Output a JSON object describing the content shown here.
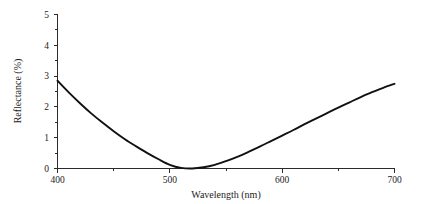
{
  "chart_data": {
    "type": "line",
    "title": "",
    "subtitle": "",
    "xlabel": "Wavelength (nm)",
    "ylabel": "Reflectance (%)",
    "xlim": [
      400,
      700
    ],
    "ylim": [
      0,
      5
    ],
    "grid": false,
    "legend": null,
    "legend_position": "none",
    "xticks": [
      400,
      500,
      600,
      700
    ],
    "xtick_labels": [
      "400",
      "500",
      "600",
      "700"
    ],
    "xticks_minor": [
      450,
      550,
      650
    ],
    "yticks": [
      0,
      1,
      2,
      3,
      4,
      5
    ],
    "ytick_labels": [
      "0",
      "1",
      "2",
      "3",
      "4",
      "5"
    ],
    "yticks_minor": [
      0.5,
      1.5,
      2.5,
      3.5,
      4.5
    ],
    "series": [
      {
        "name": "Reflectance",
        "color": "#111111",
        "x": [
          400,
          410,
          420,
          430,
          440,
          450,
          460,
          470,
          480,
          490,
          500,
          510,
          520,
          530,
          540,
          550,
          560,
          570,
          580,
          590,
          600,
          610,
          620,
          630,
          640,
          650,
          660,
          670,
          680,
          690,
          700
        ],
        "values": [
          2.85,
          2.47,
          2.12,
          1.79,
          1.49,
          1.21,
          0.95,
          0.72,
          0.5,
          0.3,
          0.12,
          0.02,
          0.0,
          0.04,
          0.12,
          0.24,
          0.38,
          0.54,
          0.71,
          0.89,
          1.07,
          1.25,
          1.44,
          1.62,
          1.8,
          1.98,
          2.15,
          2.32,
          2.48,
          2.62,
          2.75
        ]
      }
    ],
    "annotations": []
  },
  "axis": {
    "x_label": "Wavelength (nm)",
    "y_label": "Reflectance (%)",
    "x_tick_labels": [
      "400",
      "500",
      "600",
      "700"
    ],
    "y_tick_labels": [
      "0",
      "1",
      "2",
      "3",
      "4",
      "5"
    ]
  },
  "colors": {
    "background": "#ffffff",
    "axis": "#2b2b2b",
    "curve": "#111111",
    "text": "#1c1c1c"
  }
}
